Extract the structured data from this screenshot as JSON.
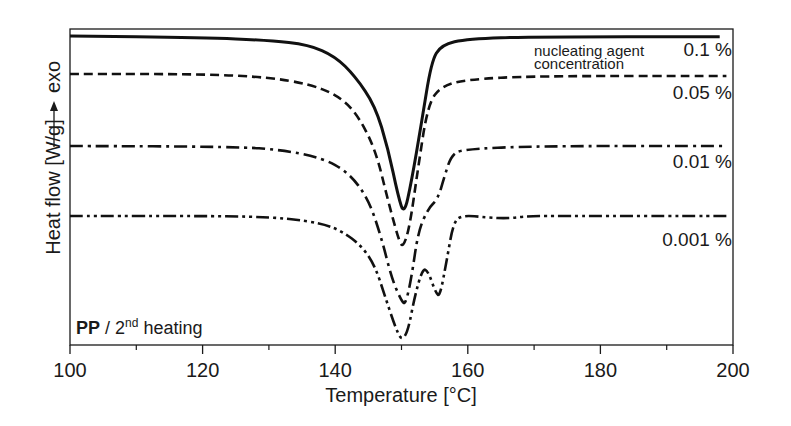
{
  "chart_data": {
    "type": "line",
    "title": "",
    "xlabel": "Temperature [°C]",
    "ylabel": "Heat flow [W/g]",
    "ylabel_annotation": "exo",
    "xlim": [
      100,
      200
    ],
    "x_ticks": [
      100,
      120,
      140,
      160,
      180,
      200
    ],
    "x_minor_ticks": [
      110,
      130,
      150,
      170,
      190
    ],
    "y_ticks": [],
    "grid": false,
    "legend_position": "inline-right",
    "annotation": {
      "bold": "PP",
      "text": " / 2",
      "sup": "nd",
      "rest": " heating"
    },
    "legend_note": [
      "nucleating agent",
      "concentration"
    ],
    "series": [
      {
        "name": "0.1 %",
        "style": "solid",
        "points": [
          [
            100,
            0.0
          ],
          [
            120,
            -0.02
          ],
          [
            130,
            -0.06
          ],
          [
            136,
            -0.12
          ],
          [
            140,
            -0.28
          ],
          [
            143,
            -0.55
          ],
          [
            146,
            -0.95
          ],
          [
            148,
            -1.55
          ],
          [
            149.5,
            -2.2
          ],
          [
            150.4,
            -2.45
          ],
          [
            151.5,
            -2.0
          ],
          [
            153,
            -1.2
          ],
          [
            154.5,
            -0.35
          ],
          [
            156,
            -0.12
          ],
          [
            160,
            -0.04
          ],
          [
            170,
            -0.01
          ],
          [
            198,
            -0.01
          ]
        ]
      },
      {
        "name": "0.05 %",
        "style": "dashed",
        "points": [
          [
            100,
            0.0
          ],
          [
            120,
            0.0
          ],
          [
            130,
            -0.05
          ],
          [
            136,
            -0.15
          ],
          [
            140,
            -0.3
          ],
          [
            143,
            -0.55
          ],
          [
            146,
            -1.1
          ],
          [
            148,
            -1.9
          ],
          [
            149.5,
            -2.45
          ],
          [
            150.2,
            -2.6
          ],
          [
            151.2,
            -2.3
          ],
          [
            152.5,
            -1.4
          ],
          [
            154,
            -0.45
          ],
          [
            156,
            -0.18
          ],
          [
            160,
            -0.08
          ],
          [
            170,
            -0.03
          ],
          [
            199,
            -0.03
          ]
        ]
      },
      {
        "name": "0.01 %",
        "style": "dash-dot",
        "points": [
          [
            100,
            0.0
          ],
          [
            125,
            -0.01
          ],
          [
            132,
            -0.06
          ],
          [
            138,
            -0.18
          ],
          [
            142,
            -0.4
          ],
          [
            145,
            -0.8
          ],
          [
            147,
            -1.4
          ],
          [
            148.5,
            -2.0
          ],
          [
            150,
            -2.35
          ],
          [
            150.6,
            -2.4
          ],
          [
            151.5,
            -2.0
          ],
          [
            152.5,
            -1.3
          ],
          [
            154,
            -0.95
          ],
          [
            155.5,
            -0.8
          ],
          [
            156.5,
            -0.45
          ],
          [
            157.5,
            -0.15
          ],
          [
            159,
            -0.05
          ],
          [
            170,
            0.0
          ],
          [
            199,
            0.0
          ]
        ]
      },
      {
        "name": "0.001 %",
        "style": "dash-dot-dot",
        "points": [
          [
            100,
            0.0
          ],
          [
            120,
            0.0
          ],
          [
            127,
            -0.01
          ],
          [
            133,
            -0.05
          ],
          [
            138,
            -0.15
          ],
          [
            141,
            -0.3
          ],
          [
            144,
            -0.6
          ],
          [
            146,
            -1.0
          ],
          [
            147.5,
            -1.6
          ],
          [
            149,
            -2.2
          ],
          [
            150,
            -2.5
          ],
          [
            151,
            -2.3
          ],
          [
            152,
            -1.6
          ],
          [
            153.2,
            -1.05
          ],
          [
            154,
            -1.1
          ],
          [
            155.2,
            -1.55
          ],
          [
            155.8,
            -1.6
          ],
          [
            156.8,
            -0.9
          ],
          [
            157.8,
            -0.15
          ],
          [
            159,
            0.02
          ],
          [
            163,
            -0.03
          ],
          [
            166,
            -0.05
          ],
          [
            169,
            0.0
          ],
          [
            175,
            0.0
          ],
          [
            199,
            0.0
          ]
        ]
      }
    ]
  }
}
